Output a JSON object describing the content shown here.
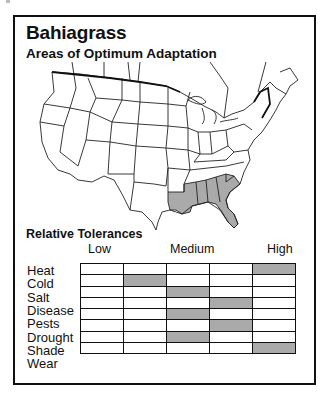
{
  "title": "Bahiagrass",
  "subtitle": "Areas of Optimum Adaptation",
  "map": {
    "description": "Outline map of the contiguous United States with southeastern states shaded",
    "shaded_regions": [
      "Louisiana",
      "Mississippi",
      "Alabama",
      "Georgia",
      "Florida",
      "South Carolina"
    ],
    "shade_color": "#aaaaaa"
  },
  "tolerances": {
    "title": "Relative Tolerances",
    "scale_labels": {
      "low": "Low",
      "medium": "Medium",
      "high": "High"
    },
    "levels": 5,
    "shade_color": "#aaaaaa",
    "rows": [
      {
        "label": "Heat",
        "level": 5
      },
      {
        "label": "Cold",
        "level": 2
      },
      {
        "label": "Salt",
        "level": 3
      },
      {
        "label": "Disease",
        "level": 4
      },
      {
        "label": "Pests",
        "level": 3
      },
      {
        "label": "Drought",
        "level": 4
      },
      {
        "label": "Shade",
        "level": 3
      },
      {
        "label": "Wear",
        "level": 5
      }
    ]
  }
}
